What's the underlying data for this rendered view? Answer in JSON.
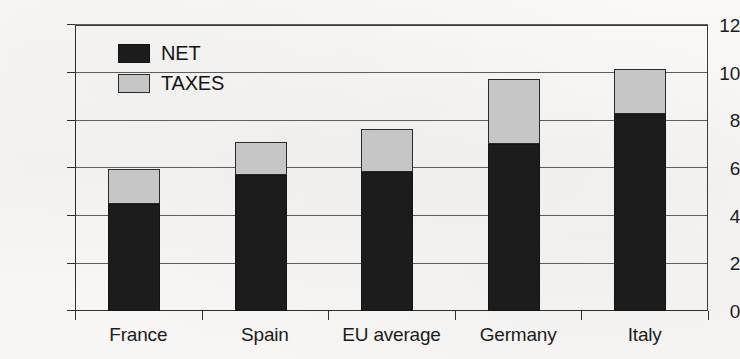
{
  "chart_data": {
    "type": "bar",
    "subtype": "stacked-vertical",
    "title": "",
    "subtitle": "",
    "xlabel": "",
    "ylabel": "",
    "categories": [
      "France",
      "Spain",
      "EU average",
      "Germany",
      "Italy"
    ],
    "series": [
      {
        "name": "NET",
        "color": "#1c1c1c",
        "values": [
          4.5,
          5.7,
          5.85,
          7.0,
          8.25
        ]
      },
      {
        "name": "TAXES",
        "color": "#c6c6c6",
        "values": [
          1.45,
          1.4,
          1.8,
          2.75,
          1.9
        ]
      }
    ],
    "totals": [
      5.95,
      7.1,
      7.65,
      9.75,
      10.15
    ],
    "ylim": [
      0,
      12
    ],
    "ytick_labels": [
      "0",
      "2",
      "4",
      "6",
      "8",
      "10",
      "12"
    ],
    "ytick_values": [
      0,
      2,
      4,
      6,
      8,
      10,
      12
    ],
    "grid": "horizontal",
    "legend_position": "top-left-inside",
    "annotations": []
  },
  "legend": {
    "entries": [
      {
        "label": "NET",
        "swatch": "black-square-swatch"
      },
      {
        "label": "TAXES",
        "swatch": "gray-square-swatch"
      }
    ]
  },
  "axes": {
    "y": {
      "labels": [
        "12",
        "10",
        "8",
        "6",
        "4",
        "2",
        "0"
      ]
    },
    "x": {
      "labels": [
        "France",
        "Spain",
        "EU average",
        "Germany",
        "Italy"
      ]
    }
  },
  "colors": {
    "net": "#1c1c1c",
    "taxes": "#c6c6c6",
    "axis": "#2e2e2e",
    "grid": "#5e5e5e",
    "background": "#f7f7f5"
  }
}
